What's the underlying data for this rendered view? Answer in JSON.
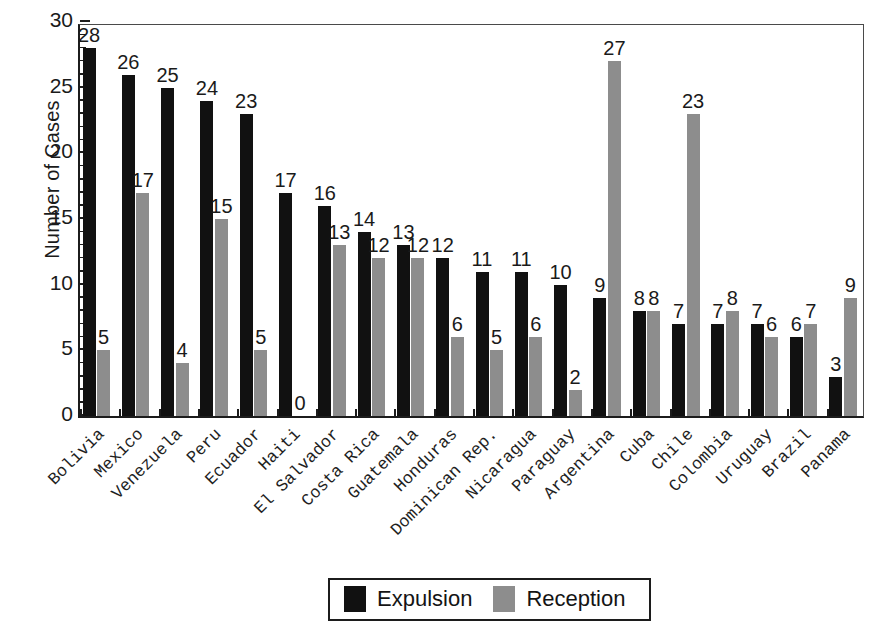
{
  "chart_data": {
    "type": "bar",
    "title": "",
    "xlabel": "",
    "ylabel": "Number of Cases",
    "ylim": [
      0,
      30
    ],
    "yticks": [
      0,
      5,
      10,
      15,
      20,
      25,
      30
    ],
    "ytick_labels": [
      "0",
      "5",
      "10",
      "15",
      "20",
      "25",
      "30"
    ],
    "grid": false,
    "legend_position": "bottom-center",
    "minor_tick_step": 1,
    "categories": [
      "Bolivia",
      "Mexico",
      "Venezuela",
      "Peru",
      "Ecuador",
      "Haiti",
      "El Salvador",
      "Costa Rica",
      "Guatemala",
      "Honduras",
      "Dominican Rep.",
      "Nicaragua",
      "Paraguay",
      "Argentina",
      "Cuba",
      "Chile",
      "Colombia",
      "Uruguay",
      "Brazil",
      "Panama"
    ],
    "series": [
      {
        "name": "Expulsion",
        "color": "#111111",
        "values": [
          28,
          26,
          25,
          24,
          23,
          17,
          16,
          14,
          13,
          12,
          11,
          11,
          10,
          9,
          8,
          7,
          7,
          7,
          6,
          3
        ]
      },
      {
        "name": "Reception",
        "color": "#8d8d8d",
        "values": [
          5,
          17,
          4,
          15,
          5,
          0,
          13,
          12,
          12,
          6,
          5,
          6,
          2,
          27,
          8,
          23,
          8,
          6,
          7,
          9
        ]
      }
    ]
  },
  "legend": {
    "items": [
      {
        "label": "Expulsion",
        "swatch": "expulsion"
      },
      {
        "label": "Reception",
        "swatch": "reception"
      }
    ]
  },
  "colors": {
    "expulsion": "#111111",
    "reception": "#8d8d8d",
    "axis": "#1c1c1c",
    "background": "#ffffff"
  }
}
